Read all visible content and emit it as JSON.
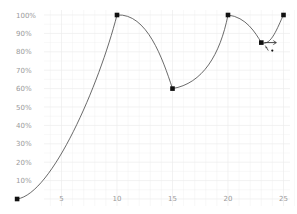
{
  "chart_data": {
    "type": "line",
    "title": "",
    "xlabel": "",
    "ylabel": "",
    "x_ticks": [
      5,
      10,
      15,
      20,
      25
    ],
    "y_ticks": [
      "10%",
      "20%",
      "30%",
      "40%",
      "50%",
      "60%",
      "70%",
      "80%",
      "90%",
      "100%"
    ],
    "xlim": [
      0,
      26
    ],
    "ylim": [
      0,
      100
    ],
    "grid": true,
    "smooth": true,
    "series": [
      {
        "name": "curve",
        "points": [
          {
            "x": 1,
            "y": 0
          },
          {
            "x": 10,
            "y": 100
          },
          {
            "x": 15,
            "y": 60
          },
          {
            "x": 20,
            "y": 100
          },
          {
            "x": 23,
            "y": 85
          },
          {
            "x": 25,
            "y": 100
          }
        ]
      }
    ],
    "cursor": {
      "type": "move-cursor",
      "near_point_index": 4
    }
  },
  "colors": {
    "grid": "#ececec",
    "curve": "#444444",
    "point": "#111111",
    "label": "#9a9a9a"
  }
}
